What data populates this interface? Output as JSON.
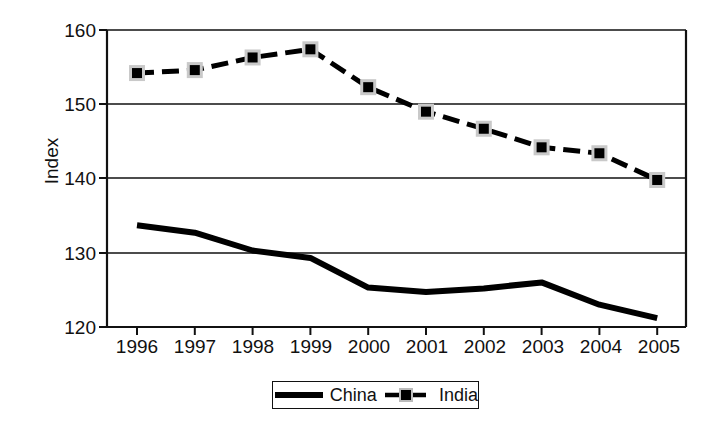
{
  "chart_data": {
    "type": "line",
    "title": "",
    "xlabel": "",
    "ylabel": "Index",
    "categories": [
      "1996",
      "1997",
      "1998",
      "1999",
      "2000",
      "2001",
      "2002",
      "2003",
      "2004",
      "2005"
    ],
    "x": [
      1996,
      1997,
      1998,
      1999,
      2000,
      2001,
      2002,
      2003,
      2004,
      2005
    ],
    "series": [
      {
        "name": "China",
        "values": [
          133.7,
          132.7,
          130.3,
          129.3,
          125.3,
          124.7,
          125.2,
          126.0,
          123.0,
          121.2
        ],
        "style": "solid",
        "marker": "none",
        "color": "#000000"
      },
      {
        "name": "India",
        "values": [
          154.2,
          154.6,
          156.3,
          157.4,
          152.3,
          149.0,
          146.7,
          144.2,
          143.4,
          139.8
        ],
        "style": "dashed",
        "marker": "square",
        "color": "#000000"
      }
    ],
    "ylim": [
      120,
      160
    ],
    "yticks": [
      120,
      130,
      140,
      150,
      160
    ],
    "xlim": [
      1995.5,
      2005.5
    ],
    "grid": "horizontal",
    "legend_position": "bottom-center",
    "legend_entries": [
      "China",
      "India"
    ]
  },
  "axis": {
    "y_label": "Index",
    "y_tick_labels": [
      "160",
      "150",
      "140",
      "130",
      "120"
    ],
    "x_tick_labels": [
      "1996",
      "1997",
      "1998",
      "1999",
      "2000",
      "2001",
      "2002",
      "2003",
      "2004",
      "2005"
    ]
  },
  "legend": {
    "china_label": "China",
    "india_label": "India"
  },
  "colors": {
    "line": "#000000",
    "axis": "#111111",
    "grid": "#111111",
    "background": "#ffffff"
  }
}
